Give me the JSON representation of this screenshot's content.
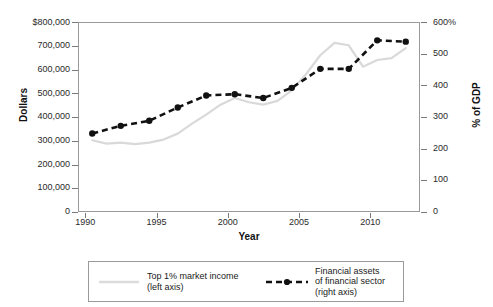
{
  "chart_data": {
    "type": "line",
    "title": "",
    "xlabel": "Year",
    "ylabel": "Dollars",
    "ylabel_right": "% of GDP",
    "xlim": [
      1989,
      2013
    ],
    "ylim": [
      0,
      800000
    ],
    "ylim_right": [
      0,
      600
    ],
    "grid": false,
    "legend_position": "below",
    "xticks": [
      1990,
      1995,
      2000,
      2005,
      2010
    ],
    "xtick_labels": [
      "1990",
      "1995",
      "2000",
      "2005",
      "2010"
    ],
    "yticks_left": [
      0,
      100000,
      200000,
      300000,
      400000,
      500000,
      600000,
      700000,
      800000
    ],
    "ytick_labels_left": [
      "0",
      "100,000",
      "200,000",
      "300,000",
      "400,000",
      "500,000",
      "600,000",
      "700,000",
      "$800,000"
    ],
    "yticks_right": [
      0,
      100,
      200,
      300,
      400,
      500,
      600
    ],
    "ytick_labels_right": [
      "0",
      "100",
      "200",
      "300",
      "400",
      "500",
      "600%"
    ],
    "series": [
      {
        "name": "Top 1% market income",
        "axis": "left",
        "color": "#d9d9d9",
        "style": "solid",
        "marker": "none",
        "x": [
          1990,
          1991,
          1992,
          1993,
          1994,
          1995,
          1996,
          1997,
          1998,
          1999,
          2000,
          2001,
          2002,
          2003,
          2004,
          2005,
          2006,
          2007,
          2008,
          2009,
          2010,
          2011,
          2012
        ],
        "values": [
          302000,
          288000,
          292000,
          286000,
          292000,
          305000,
          330000,
          372000,
          410000,
          452000,
          480000,
          462000,
          452000,
          468000,
          512000,
          580000,
          660000,
          712000,
          702000,
          612000,
          640000,
          648000,
          690000
        ]
      },
      {
        "name": "Financial assets of financial sector",
        "axis": "right",
        "color": "#111111",
        "style": "dashed",
        "marker": "circle",
        "x": [
          1990,
          1992,
          1994,
          1996,
          1998,
          2000,
          2002,
          2004,
          2006,
          2008,
          2010,
          2012
        ],
        "values": [
          248,
          272,
          288,
          330,
          368,
          372,
          360,
          392,
          452,
          452,
          542,
          538
        ],
        "values_left_equivalent": [
          330000,
          362000,
          385000,
          440000,
          490000,
          495000,
          480000,
          522000,
          602000,
          602000,
          722000,
          718000
        ]
      }
    ]
  },
  "axes": {
    "left_title": "Dollars",
    "right_title": "% of GDP",
    "x_title": "Year"
  },
  "legend": {
    "entries": [
      {
        "label": "Top 1% market income\n(left axis)",
        "key": "solid-gray-line-key"
      },
      {
        "label": "Financial assets\nof financial sector\n(right axis)",
        "key": "dashed-black-marker-key"
      }
    ]
  },
  "colors": {
    "series_gray": "#d9d9d9",
    "series_black": "#111111",
    "frame": "#9a9a9a",
    "text": "#1a1a1a",
    "background": "#ffffff"
  }
}
